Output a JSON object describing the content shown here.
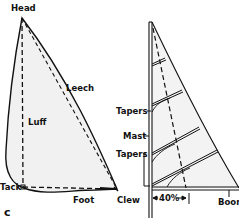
{
  "figure": {
    "panel_letter": "c",
    "left_sail": {
      "labels": {
        "head": "Head",
        "leech": "Leech",
        "luff": "Luff",
        "tack": "Tack",
        "foot": "Foot",
        "clew": "Clew"
      }
    },
    "right_sail": {
      "labels": {
        "tapers_upper": "Tapers",
        "mast": "Mast",
        "tapers_lower": "Tapers",
        "percent": "40%",
        "boom": "Boom"
      }
    },
    "colors": {
      "ink": "#111111",
      "sail_fill": "#f1f1f1",
      "background": "#ffffff"
    }
  }
}
